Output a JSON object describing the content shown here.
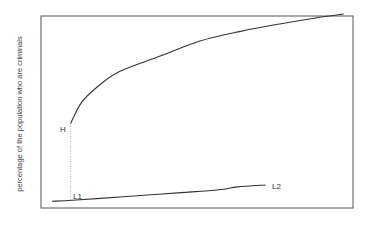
{
  "chart_data": {
    "type": "line",
    "title": "",
    "xlabel": "",
    "ylabel": "percentage of the population who are criminals",
    "xlim": [
      0,
      100
    ],
    "ylim": [
      0,
      100
    ],
    "grid": false,
    "series": [
      {
        "name": "upper-branch",
        "start_label": "H",
        "points": [
          [
            9.5,
            44
          ],
          [
            13,
            55
          ],
          [
            18,
            63
          ],
          [
            25,
            71
          ],
          [
            38,
            79
          ],
          [
            51,
            87
          ],
          [
            64,
            92
          ],
          [
            77,
            96
          ],
          [
            88,
            99
          ],
          [
            97,
            101
          ]
        ]
      },
      {
        "name": "lower-branch",
        "start_label": "L1",
        "end_label": "L2",
        "points": [
          [
            3.5,
            3.5
          ],
          [
            10,
            4
          ],
          [
            19,
            5
          ],
          [
            32,
            6.5
          ],
          [
            45,
            8
          ],
          [
            57,
            9.5
          ],
          [
            63,
            11
          ],
          [
            72,
            12
          ]
        ]
      }
    ],
    "annotations": [
      {
        "type": "dotted-vertical",
        "x": 9.5,
        "from": 4,
        "to": 44
      }
    ],
    "labels": {
      "H": "H",
      "L1": "L1",
      "L2": "L2"
    }
  }
}
